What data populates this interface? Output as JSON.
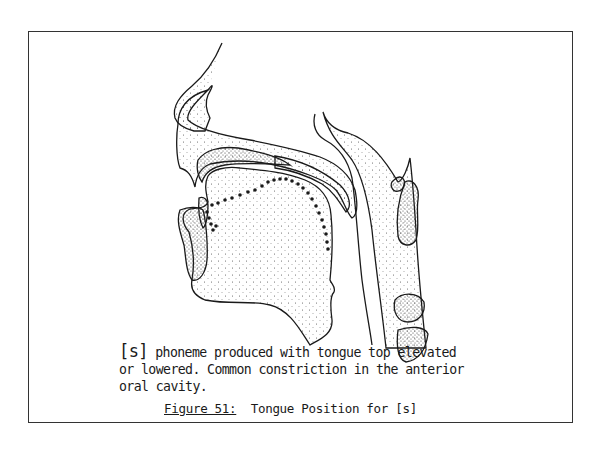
{
  "figure": {
    "description_lines": [
      "[s] phoneme produced with tongue top elevated",
      "or lowered. Common constriction in the anterior",
      "oral cavity."
    ],
    "description_prefix": "[s]",
    "description_line1_rest": " phoneme produced with tongue top elevated",
    "description_line2": "or lowered. Common constriction in the anterior",
    "description_line3": "oral cavity.",
    "caption_label": "Figure 51:",
    "caption_title": "  Tongue Position for [s]"
  },
  "illustration": {
    "subject": "sagittal section of head showing vocal tract",
    "tongue_outline": "dotted line indicating tongue position",
    "colors": {
      "ink": "#1a1a1a",
      "paper": "#ffffff"
    }
  }
}
